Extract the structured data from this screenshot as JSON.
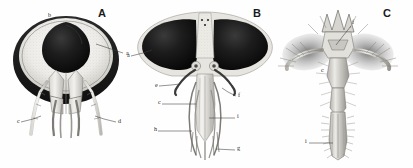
{
  "plate": {
    "title": "Comparative anatomy plate: three insect head and mouthpart figures",
    "background_color": "#fefefe",
    "ink_color": "#2b2b2b",
    "dark_fill_color": "#141414",
    "mid_tone_color": "#8a8a8a",
    "light_tone_color": "#e4e2dd"
  },
  "panels": [
    {
      "id": "A",
      "letter": "A",
      "letter_x": 98,
      "letter_y": 17,
      "caption": "Frontal view of head showing broad dark marginal band, pale frons and descending appendages",
      "labels": [
        {
          "text": "b",
          "x": 48,
          "y": 17,
          "leader": null
        },
        {
          "text": "a",
          "x": 126,
          "y": 55,
          "leader": [
            [
              123,
              53
            ],
            [
              108,
              48
            ],
            [
              96,
              44
            ]
          ]
        },
        {
          "text": "c",
          "x": 17,
          "y": 123,
          "leader": [
            [
              21,
              122
            ],
            [
              33,
              119
            ],
            [
              41,
              116
            ]
          ]
        },
        {
          "text": "d",
          "x": 118,
          "y": 123,
          "leader": [
            [
              116,
              122
            ],
            [
              104,
              119
            ],
            [
              95,
              116
            ]
          ]
        }
      ]
    },
    {
      "id": "B",
      "letter": "B",
      "letter_x": 253,
      "letter_y": 17,
      "caption": "Frontal view of head with paired dark compound eyes, pale median frons and elongate mouthparts",
      "labels": [
        {
          "text": "a",
          "x": 127,
          "y": 57,
          "leader": [
            [
              131,
              56
            ],
            [
              143,
              53
            ],
            [
              152,
              50
            ]
          ]
        },
        {
          "text": "e",
          "x": 155,
          "y": 87,
          "leader": [
            [
              159,
              86
            ],
            [
              171,
              85
            ],
            [
              180,
              84
            ]
          ]
        },
        {
          "text": "f",
          "x": 238,
          "y": 97,
          "leader": [
            [
              236,
              96
            ],
            [
              228,
              92
            ],
            [
              222,
              88
            ]
          ]
        },
        {
          "text": "c",
          "x": 158,
          "y": 104,
          "leader": [
            [
              162,
              104
            ],
            [
              182,
              104
            ],
            [
              196,
              104
            ]
          ]
        },
        {
          "text": "i",
          "x": 237,
          "y": 118,
          "leader": [
            [
              235,
              118
            ],
            [
              220,
              118
            ],
            [
              209,
              118
            ]
          ]
        },
        {
          "text": "h",
          "x": 154,
          "y": 131,
          "leader": [
            [
              158,
              131
            ],
            [
              178,
              131
            ],
            [
              192,
              131
            ]
          ]
        },
        {
          "text": "g",
          "x": 237,
          "y": 150,
          "leader": [
            [
              235,
              150
            ],
            [
              224,
              150
            ],
            [
              216,
              149
            ]
          ]
        }
      ]
    },
    {
      "id": "C",
      "letter": "C",
      "letter_x": 383,
      "letter_y": 17,
      "caption": "Frontal view of a hairy head with crown-like projections, lateral palps and elongate fringed labium",
      "labels": [
        {
          "text": "f",
          "x": 352,
          "y": 24,
          "leader": [
            [
              351,
              26
            ],
            [
              343,
              36
            ],
            [
              336,
              45
            ]
          ]
        },
        {
          "text": "c",
          "x": 321,
          "y": 72,
          "leader": null
        },
        {
          "text": "i",
          "x": 305,
          "y": 143,
          "leader": [
            [
              309,
              143
            ],
            [
              324,
              143
            ],
            [
              333,
              143
            ]
          ]
        }
      ]
    }
  ]
}
